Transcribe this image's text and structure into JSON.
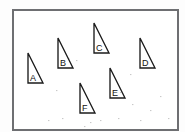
{
  "worksheet": {
    "title": "Right triangles on a square grid",
    "background_color": "#fdfdfd",
    "paper_color": "#ffffff"
  },
  "grid": {
    "origin_x": 13,
    "origin_y": 10,
    "cell_size": 15,
    "columns": 11,
    "rows": 8,
    "line_color": "#8f9093",
    "border_color": "#6e6f72",
    "right_edge": 178,
    "bottom_edge": 130
  },
  "chart_data": {
    "type": "diagram",
    "xlabel": "",
    "ylabel": "",
    "grid": true,
    "grid_cell_size": 15,
    "grid_columns": 11,
    "grid_rows": 8,
    "shape_type": "right-triangle",
    "shapes": [
      {
        "name": "A",
        "label": "A",
        "vertices": [
          [
            28,
            53
          ],
          [
            28,
            83
          ],
          [
            43,
            83
          ]
        ],
        "leg_vertical_cells": 2,
        "leg_horizontal_cells": 1,
        "label_x": 30,
        "label_y": 81
      },
      {
        "name": "B",
        "label": "B",
        "vertices": [
          [
            58,
            38
          ],
          [
            58,
            68
          ],
          [
            73,
            68
          ]
        ],
        "leg_vertical_cells": 2,
        "leg_horizontal_cells": 1,
        "label_x": 60,
        "label_y": 66
      },
      {
        "name": "C",
        "label": "C",
        "vertices": [
          [
            94,
            23
          ],
          [
            94,
            53
          ],
          [
            109,
            53
          ]
        ],
        "leg_vertical_cells": 2,
        "leg_horizontal_cells": 1,
        "label_x": 96,
        "label_y": 51
      },
      {
        "name": "D",
        "label": "D",
        "vertices": [
          [
            140,
            38
          ],
          [
            140,
            68
          ],
          [
            155,
            68
          ]
        ],
        "leg_vertical_cells": 2,
        "leg_horizontal_cells": 1,
        "label_x": 142,
        "label_y": 66
      },
      {
        "name": "E",
        "label": "E",
        "vertices": [
          [
            110,
            68
          ],
          [
            110,
            98
          ],
          [
            125,
            98
          ]
        ],
        "leg_vertical_cells": 2,
        "leg_horizontal_cells": 1,
        "label_x": 112,
        "label_y": 96
      },
      {
        "name": "F",
        "label": "F",
        "vertices": [
          [
            80,
            83
          ],
          [
            80,
            113
          ],
          [
            95,
            113
          ]
        ],
        "leg_vertical_cells": 2,
        "leg_horizontal_cells": 1,
        "label_x": 82,
        "label_y": 111
      }
    ],
    "legend": [],
    "annotations": []
  }
}
